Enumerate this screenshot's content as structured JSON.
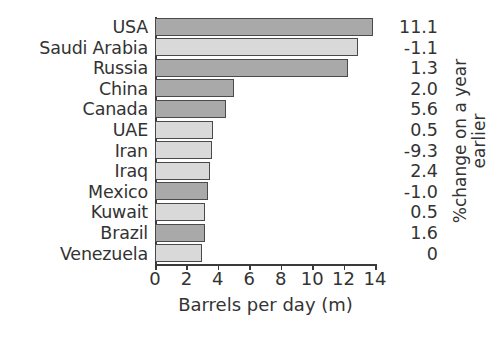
{
  "chart_data": {
    "type": "bar",
    "orientation": "horizontal",
    "title": "",
    "xlabel": "Barrels per day (m)",
    "ylabel": "",
    "right_axis_label_lines": [
      "%change on a year",
      "earlier"
    ],
    "right_axis_label": "%change on a year earlier",
    "xlim": [
      0,
      14
    ],
    "xticks": [
      0,
      2,
      4,
      6,
      8,
      10,
      12,
      14
    ],
    "xticklabels": [
      "0",
      "2",
      "4",
      "6",
      "8",
      "10",
      "12",
      "14"
    ],
    "grid": false,
    "legend": "none",
    "categories": [
      "USA",
      "Saudi Arabia",
      "Russia",
      "China",
      "Canada",
      "UAE",
      "Iran",
      "Iraq",
      "Mexico",
      "Kuwait",
      "Brazil",
      "Venezuela"
    ],
    "values": [
      13.9,
      12.9,
      12.3,
      5.0,
      4.5,
      3.7,
      3.6,
      3.5,
      3.4,
      3.2,
      3.2,
      3.0
    ],
    "value_labels": [
      "11.1",
      "-1.1",
      "1.3",
      "2.0",
      "5.6",
      "0.5",
      "-9.3",
      "2.4",
      "-1.0",
      "0.5",
      "1.6",
      "0"
    ],
    "value_label_series_name": "%change on a year earlier",
    "bar_shades": [
      "dark",
      "light",
      "dark",
      "dark",
      "dark",
      "light",
      "light",
      "light",
      "dark",
      "light",
      "dark",
      "light"
    ],
    "colors": {
      "bar_dark": "#a9a9a9",
      "bar_light": "#d9d9d9",
      "bar_edge": "#4a4a4a",
      "axis": "#3a3a3a",
      "text": "#333333",
      "background": "#ffffff"
    }
  }
}
